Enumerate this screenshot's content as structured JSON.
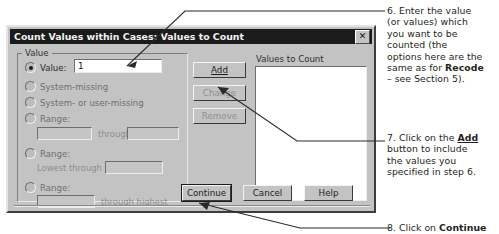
{
  "dialog": {
    "title": "Count Values within Cases: Values to Count",
    "close_label": "✕",
    "value_group": {
      "legend": "Value",
      "options": [
        {
          "label": "Value:",
          "underline": "V",
          "selected": true
        },
        {
          "label": "System-missing",
          "underline": "S",
          "selected": false
        },
        {
          "label": "System- or user-missing",
          "underline": "u",
          "selected": false
        },
        {
          "label": "Range:",
          "underline": "R",
          "selected": false
        },
        {
          "label": "Range:",
          "underline": "",
          "selected": false
        },
        {
          "label": "Range:",
          "underline": "",
          "selected": false
        }
      ],
      "value_input": "1",
      "range1_low": "",
      "range1_high": "",
      "range1_separator": "through",
      "range2_prefix": "Lowest through",
      "range2_value": "",
      "range3_value": "",
      "range3_suffix": "through highest"
    },
    "action_buttons": [
      {
        "label": "Add",
        "underline": "A",
        "enabled": true
      },
      {
        "label": "Change",
        "underline": "C",
        "enabled": false
      },
      {
        "label": "Remove",
        "underline": "R",
        "enabled": false
      }
    ],
    "values_panel": {
      "label": "Values to Count",
      "items": []
    },
    "footer_buttons": [
      {
        "label": "Continue",
        "default": true
      },
      {
        "label": "Cancel",
        "default": false
      },
      {
        "label": "Help",
        "default": false
      }
    ]
  },
  "annotations": [
    {
      "id": "annot6",
      "lines": [
        "6. Enter the value",
        "(or values) which",
        "you want to be",
        "counted  (the",
        "options here are the",
        "same as for ",
        "– see Section 5)."
      ],
      "bold_word": "Recode"
    },
    {
      "id": "annot7",
      "lines": [
        "7. Click on the ",
        "button to include",
        "the values you",
        "specified in step 6."
      ],
      "bold_word": "Add"
    },
    {
      "id": "annot8",
      "lines": [
        "8. Click on "
      ],
      "bold_word": "Continue"
    }
  ],
  "colors": {
    "dialog_face": "#c3c3c3",
    "titlebar": "#1b1b1b",
    "titlebar_text": "#f2f2f2",
    "field_bg": "#ffffff",
    "disabled_text": "#8f8f8f",
    "annotation_text": "#231f20",
    "leader_line": "#2a2a2a"
  }
}
